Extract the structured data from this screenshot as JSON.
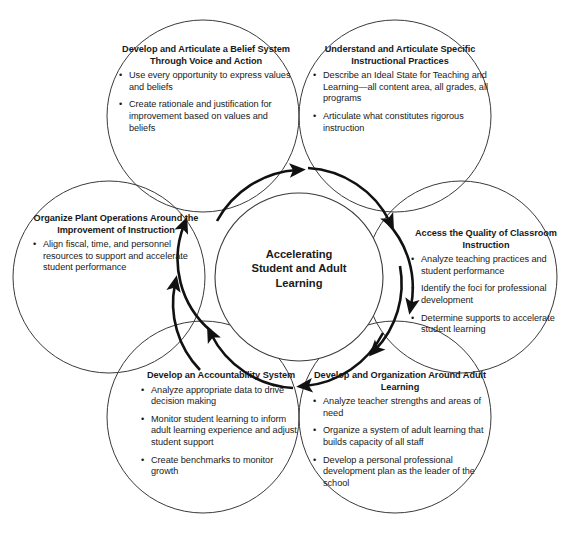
{
  "diagram": {
    "type": "cycle-venn",
    "title_center": "Accelerating\nStudent and Adult\nLearning",
    "center": {
      "label_line1": "Accelerating",
      "label_line2": "Student and Adult",
      "label_line3": "Learning"
    },
    "stroke_color": "#3a3a3a",
    "arrow_color": "#111111",
    "text_color": "#1a1a1a",
    "background": "#ffffff",
    "nodes": [
      {
        "id": "belief",
        "position": "top-left",
        "title": "Develop and Articulate a Belief System Through Voice and Action",
        "bullets": [
          "Use every opportunity to express values and beliefs",
          "Create rationale and justification for improvement based on values and beliefs"
        ]
      },
      {
        "id": "practices",
        "position": "top-right",
        "title": "Understand and Articulate Specific Instructional Practices",
        "bullets": [
          "Describe an Ideal State for Teaching and Learning—all content area, all grades, all programs",
          "Articulate what constitutes rigorous instruction"
        ]
      },
      {
        "id": "quality",
        "position": "right",
        "title": "Access the Quality of Classroom Instruction",
        "bullets": [
          "Analyze teaching practices and student performance",
          "Identify the foci for professional development",
          "Determine supports to accelerate student learning"
        ]
      },
      {
        "id": "adult",
        "position": "bottom-right",
        "title": "Develop and Organization Around Adult Learning",
        "bullets": [
          "Analyze teacher strengths and areas of need",
          "Organize a system of adult learning that builds capacity of all staff",
          "Develop a personal professional development plan as the leader of the school"
        ]
      },
      {
        "id": "account",
        "position": "bottom-left",
        "title": "Develop an Accountability System",
        "bullets": [
          "Analyze appropriate data to drive decision making",
          "Monitor student learning to inform adult learning experience and adjust student support",
          "Create benchmarks to monitor growth"
        ]
      },
      {
        "id": "plant",
        "position": "left",
        "title": "Organize Plant Operations Around the Improvement of Instruction",
        "bullets": [
          "Align fiscal, time, and personnel resources to support and accelerate student performance"
        ]
      }
    ],
    "arrows": [
      {
        "id": "arrow-plant-to-belief",
        "from": "plant",
        "to": "belief",
        "direction": "clockwise"
      },
      {
        "id": "arrow-belief-to-practices",
        "from": "belief",
        "to": "practices",
        "direction": "clockwise"
      },
      {
        "id": "arrow-practices-to-quality",
        "from": "practices",
        "to": "quality",
        "direction": "clockwise"
      },
      {
        "id": "arrow-quality-to-adult",
        "from": "quality",
        "to": "adult",
        "direction": "clockwise"
      },
      {
        "id": "arrow-adult-to-account",
        "from": "adult",
        "to": "account",
        "direction": "clockwise"
      },
      {
        "id": "arrow-account-to-plant",
        "from": "account",
        "to": "plant",
        "direction": "clockwise"
      }
    ],
    "bullet_glyph": "•"
  }
}
